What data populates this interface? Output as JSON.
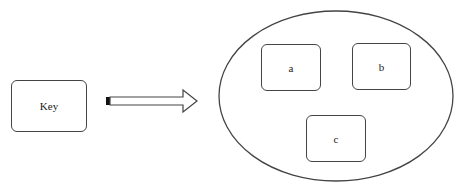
{
  "diagram": {
    "source": {
      "label": "Key"
    },
    "arrow": {
      "direction": "right"
    },
    "container": {
      "shape": "ellipse",
      "items": [
        {
          "label": "a"
        },
        {
          "label": "b"
        },
        {
          "label": "c"
        }
      ]
    }
  },
  "colors": {
    "stroke": "#444444",
    "background": "#ffffff",
    "arrow_tail": "#111111"
  }
}
